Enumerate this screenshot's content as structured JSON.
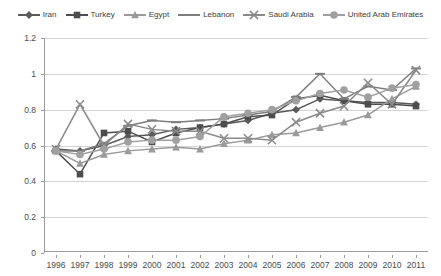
{
  "chart_data": {
    "type": "line",
    "title": "",
    "xlabel": "",
    "ylabel": "",
    "grid": true,
    "legend_position": "top",
    "ylim": [
      0,
      1.2
    ],
    "yticks": [
      "0",
      "0.2",
      "0.4",
      "0.6",
      "0.8",
      "1",
      "1.2"
    ],
    "ytick_values": [
      0,
      0.2,
      0.4,
      0.6,
      0.8,
      1.0,
      1.2
    ],
    "categories": [
      "1996",
      "1997",
      "1998",
      "1999",
      "2000",
      "2001",
      "2002",
      "2003",
      "2004",
      "2005",
      "2006",
      "2007",
      "2008",
      "2009",
      "2010",
      "2011"
    ],
    "x": [
      1996,
      1997,
      1998,
      1999,
      2000,
      2001,
      2002,
      2003,
      2004,
      2005,
      2006,
      2007,
      2008,
      2009,
      2010,
      2011
    ],
    "series": [
      {
        "name": "Iran",
        "marker": "diamond",
        "color": "#5a5a5a",
        "values": [
          0.58,
          0.57,
          0.6,
          0.65,
          0.66,
          0.69,
          0.7,
          0.72,
          0.74,
          0.78,
          0.8,
          0.86,
          0.85,
          0.84,
          0.84,
          0.83
        ]
      },
      {
        "name": "Turkey",
        "marker": "square",
        "color": "#4d4d4d",
        "values": [
          0.57,
          0.44,
          0.67,
          0.68,
          0.62,
          0.67,
          0.7,
          0.72,
          0.76,
          0.77,
          0.86,
          0.88,
          0.85,
          0.83,
          0.83,
          0.82
        ]
      },
      {
        "name": "Egypt",
        "marker": "triangle",
        "color": "#9a9a9a",
        "values": [
          0.57,
          0.5,
          0.55,
          0.57,
          0.58,
          0.59,
          0.58,
          0.61,
          0.63,
          0.66,
          0.67,
          0.7,
          0.73,
          0.77,
          0.86,
          0.93
        ]
      },
      {
        "name": "Lebanon",
        "marker": "line",
        "color": "#7d7d7d",
        "values": [
          0.57,
          0.57,
          0.61,
          0.71,
          0.74,
          0.73,
          0.74,
          0.75,
          0.77,
          0.79,
          0.87,
          1.0,
          0.86,
          0.93,
          0.91,
          1.03
        ]
      },
      {
        "name": "Saudi Arabia",
        "marker": "cross",
        "color": "#8a8a8a",
        "values": [
          0.58,
          0.83,
          0.6,
          0.72,
          0.69,
          0.68,
          0.68,
          0.64,
          0.64,
          0.63,
          0.73,
          0.78,
          0.82,
          0.95,
          0.83,
          1.02
        ]
      },
      {
        "name": "United Arab Emirates",
        "marker": "circle",
        "color": "#a0a0a0",
        "values": [
          0.57,
          0.55,
          0.58,
          0.62,
          0.63,
          0.63,
          0.65,
          0.76,
          0.78,
          0.8,
          0.85,
          0.89,
          0.91,
          0.87,
          0.92,
          0.94
        ]
      }
    ]
  }
}
